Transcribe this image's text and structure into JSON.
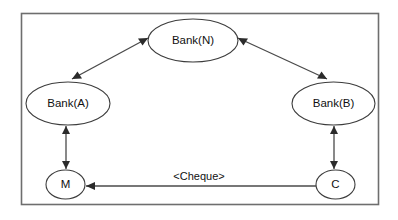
{
  "diagram": {
    "type": "node-edge-graph",
    "background_color": "#ffffff",
    "frame": {
      "name": "outer-boundary",
      "stroke_color": "#6e6e6e"
    },
    "nodes": [
      {
        "id": "bank_n",
        "label": "Bank(N)",
        "shape": "ellipse",
        "position": "top-center"
      },
      {
        "id": "bank_a",
        "label": "Bank(A)",
        "shape": "ellipse",
        "position": "middle-left"
      },
      {
        "id": "bank_b",
        "label": "Bank(B)",
        "shape": "ellipse",
        "position": "middle-right"
      },
      {
        "id": "m",
        "label": "M",
        "shape": "ellipse",
        "position": "bottom-left"
      },
      {
        "id": "c",
        "label": "C",
        "shape": "ellipse",
        "position": "bottom-right"
      }
    ],
    "edges": [
      {
        "id": "edge_a_n",
        "from": "bank_a",
        "to": "bank_n",
        "direction": "bidirectional",
        "label": ""
      },
      {
        "id": "edge_b_n",
        "from": "bank_b",
        "to": "bank_n",
        "direction": "bidirectional",
        "label": ""
      },
      {
        "id": "edge_a_m",
        "from": "bank_a",
        "to": "m",
        "direction": "bidirectional",
        "label": ""
      },
      {
        "id": "edge_b_c",
        "from": "bank_b",
        "to": "c",
        "direction": "bidirectional",
        "label": ""
      },
      {
        "id": "edge_c_m",
        "from": "c",
        "to": "m",
        "direction": "unidirectional",
        "label": "<Cheque>"
      }
    ],
    "labels": {
      "bank_n": "Bank(N)",
      "bank_a": "Bank(A)",
      "bank_b": "Bank(B)",
      "m": "M",
      "c": "C",
      "cheque": "<Cheque>"
    },
    "colors": {
      "node_stroke": "#3c3c3c",
      "edge_stroke": "#4a4a4a",
      "arrow_fill": "#2b2b2b",
      "text": "#111111"
    }
  }
}
